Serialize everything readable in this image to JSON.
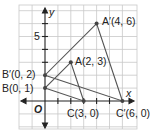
{
  "diagram": {
    "type": "coordinate-plane-dilation",
    "axes": {
      "x_label": "x",
      "y_label": "y",
      "origin_label": "O",
      "y_tick_label": "5"
    },
    "points": [
      {
        "name": "A",
        "label": "A(2, 3)",
        "x": 2,
        "y": 3
      },
      {
        "name": "B",
        "label": "B(0, 1)",
        "x": 0,
        "y": 1
      },
      {
        "name": "C",
        "label": "C(3, 0)",
        "x": 3,
        "y": 0
      },
      {
        "name": "A'",
        "label": "A′(4, 6)",
        "x": 4,
        "y": 6
      },
      {
        "name": "B'",
        "label": "B′(0, 2)",
        "x": 0,
        "y": 2
      },
      {
        "name": "C'",
        "label": "C′(6, 0)",
        "x": 6,
        "y": 0
      }
    ],
    "triangles": [
      {
        "name": "ABC",
        "vertices": [
          "A",
          "B",
          "C"
        ]
      },
      {
        "name": "A'B'C'",
        "vertices": [
          "A'",
          "B'",
          "C'"
        ]
      }
    ],
    "colors": {
      "grid": "#c8c8c8",
      "axis": "#222222",
      "triangle": "#555555",
      "point": "#444444"
    }
  }
}
